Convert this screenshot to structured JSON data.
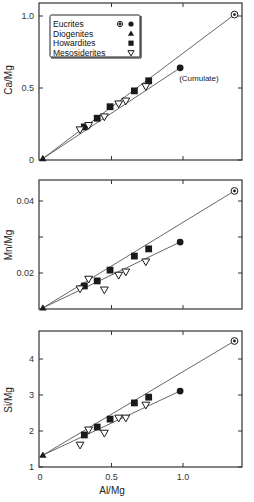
{
  "chart_data": [
    {
      "type": "scatter",
      "panel": "top",
      "title": "",
      "xlabel": "",
      "ylabel": "Ca/Mg",
      "xlim": [
        0,
        1.41
      ],
      "ylim": [
        0,
        1.1
      ],
      "yticks": [
        0,
        0.5,
        1.0
      ],
      "ytick_labels": [
        "0",
        "0.5",
        "1.0"
      ],
      "xticks": [
        0.5,
        1.0
      ],
      "grid": false,
      "legend": {
        "position": "upper-left",
        "entries": [
          {
            "label": "Eucrites",
            "markers": [
              "circled-dot",
              "filled-circle"
            ]
          },
          {
            "label": "Diogenites",
            "markers": [
              "filled-triangle"
            ]
          },
          {
            "label": "Howardites",
            "markers": [
              "filled-square"
            ]
          },
          {
            "label": "Mesosiderites",
            "markers": [
              "open-inverted-triangle"
            ]
          }
        ]
      },
      "annotations": [
        {
          "text": "(Cumulate)",
          "x": 0.98,
          "y": 0.64
        }
      ],
      "lines": [
        {
          "name": "diogenite-eucrite mixing line",
          "x": [
            0.02,
            1.36
          ],
          "y": [
            0.01,
            1.01
          ]
        },
        {
          "name": "diogenite-cumulate eucrite mixing line",
          "x": [
            0.02,
            0.98
          ],
          "y": [
            0.01,
            0.64
          ]
        }
      ],
      "series": [
        {
          "name": "Eucrites",
          "marker": "circled-dot",
          "x": [
            1.36
          ],
          "y": [
            1.01
          ]
        },
        {
          "name": "Eucrites (Cumulate)",
          "marker": "filled-circle",
          "x": [
            0.98
          ],
          "y": [
            0.64
          ]
        },
        {
          "name": "Diogenites",
          "marker": "filled-triangle",
          "x": [
            0.02
          ],
          "y": [
            0.01
          ]
        },
        {
          "name": "Howardites",
          "marker": "filled-square",
          "x": [
            0.31,
            0.4,
            0.49,
            0.66,
            0.76
          ],
          "y": [
            0.23,
            0.29,
            0.37,
            0.48,
            0.55
          ]
        },
        {
          "name": "Mesosiderites",
          "marker": "open-inverted-triangle",
          "x": [
            0.28,
            0.34,
            0.45,
            0.55,
            0.6,
            0.74
          ],
          "y": [
            0.21,
            0.24,
            0.3,
            0.39,
            0.41,
            0.51
          ]
        }
      ]
    },
    {
      "type": "scatter",
      "panel": "middle",
      "title": "",
      "xlabel": "",
      "ylabel": "Mn/Mg",
      "xlim": [
        0,
        1.41
      ],
      "ylim": [
        0.01,
        0.0458
      ],
      "yticks": [
        0.02,
        0.03,
        0.04
      ],
      "ytick_labels": [
        "0.02",
        "",
        "0.04"
      ],
      "xticks": [
        0.5,
        1.0
      ],
      "grid": false,
      "lines": [
        {
          "name": "diogenite-eucrite mixing line",
          "x": [
            0.02,
            1.36
          ],
          "y": [
            0.0103,
            0.0428
          ]
        },
        {
          "name": "diogenite-cumulate eucrite mixing line",
          "x": [
            0.02,
            0.98
          ],
          "y": [
            0.0103,
            0.0286
          ]
        }
      ],
      "series": [
        {
          "name": "Eucrites",
          "marker": "circled-dot",
          "x": [
            1.36
          ],
          "y": [
            0.0428
          ]
        },
        {
          "name": "Eucrites (Cumulate)",
          "marker": "filled-circle",
          "x": [
            0.98
          ],
          "y": [
            0.0286
          ]
        },
        {
          "name": "Diogenites",
          "marker": "filled-triangle",
          "x": [
            0.02
          ],
          "y": [
            0.0103
          ]
        },
        {
          "name": "Howardites",
          "marker": "filled-square",
          "x": [
            0.31,
            0.4,
            0.49,
            0.66,
            0.76
          ],
          "y": [
            0.0164,
            0.0178,
            0.0208,
            0.0247,
            0.0267
          ]
        },
        {
          "name": "Mesosiderites",
          "marker": "open-inverted-triangle",
          "x": [
            0.28,
            0.34,
            0.45,
            0.55,
            0.6,
            0.74
          ],
          "y": [
            0.0156,
            0.0183,
            0.0153,
            0.0194,
            0.0203,
            0.0231
          ]
        }
      ]
    },
    {
      "type": "scatter",
      "panel": "bottom",
      "title": "",
      "xlabel": "Al/Mg",
      "ylabel": "Si/Mg",
      "xlim": [
        0,
        1.41
      ],
      "ylim": [
        1,
        4.77
      ],
      "yticks": [
        1,
        2,
        3,
        4
      ],
      "ytick_labels": [
        "1",
        "2",
        "3",
        "4"
      ],
      "xticks": [
        0,
        0.5,
        1.0
      ],
      "xtick_labels": [
        "0",
        "0.5",
        "1.0"
      ],
      "grid": false,
      "lines": [
        {
          "name": "diogenite-eucrite mixing line",
          "x": [
            0.02,
            1.36
          ],
          "y": [
            1.33,
            4.5
          ]
        },
        {
          "name": "diogenite-cumulate eucrite mixing line",
          "x": [
            0.02,
            0.98
          ],
          "y": [
            1.33,
            3.11
          ]
        }
      ],
      "series": [
        {
          "name": "Eucrites",
          "marker": "circled-dot",
          "x": [
            1.36
          ],
          "y": [
            4.5
          ]
        },
        {
          "name": "Eucrites (Cumulate)",
          "marker": "filled-circle",
          "x": [
            0.98
          ],
          "y": [
            3.11
          ]
        },
        {
          "name": "Diogenites",
          "marker": "filled-triangle",
          "x": [
            0.02
          ],
          "y": [
            1.33
          ]
        },
        {
          "name": "Howardites",
          "marker": "filled-square",
          "x": [
            0.31,
            0.4,
            0.49,
            0.66,
            0.76
          ],
          "y": [
            1.89,
            2.11,
            2.33,
            2.78,
            2.94
          ]
        },
        {
          "name": "Mesosiderites",
          "marker": "open-inverted-triangle",
          "x": [
            0.28,
            0.34,
            0.45,
            0.55,
            0.6,
            0.74
          ],
          "y": [
            1.61,
            2.03,
            1.94,
            2.36,
            2.36,
            2.72
          ]
        }
      ]
    }
  ],
  "colors": {
    "ink": "#1a1a1a",
    "line": "#555555",
    "background": "#ffffff"
  },
  "layout": {
    "x_px": {
      "x0": 40,
      "scale": 143,
      "left": 39,
      "right": 242
    },
    "panels": [
      {
        "top": 3,
        "bottom": 160,
        "y0": 0,
        "yscale": 144,
        "ylabel_y": 80,
        "ytick_x": 34
      },
      {
        "top": 180,
        "bottom": 309,
        "y0": 0.01,
        "yscale": 3600,
        "ylabel_y": 245,
        "ytick_x": 34
      },
      {
        "top": 331,
        "bottom": 467,
        "y0": 1,
        "yscale": 36,
        "ylabel_y": 400,
        "ytick_x": 34
      }
    ]
  }
}
